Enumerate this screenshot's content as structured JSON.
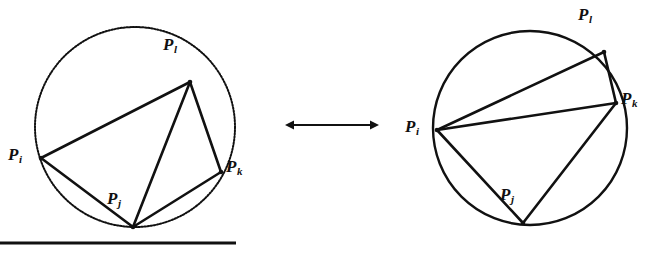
{
  "figure": {
    "type": "geometric-diagram",
    "background_color": "#ffffff",
    "ink_color": "#111111",
    "arrow": {
      "name": "bidirectional-transformation-arrow",
      "glyph": "double-headed-arrow",
      "x1": 285,
      "y1": 125,
      "x2": 379,
      "y2": 125
    },
    "baseline_rule": {
      "name": "page-rule",
      "x1": 0,
      "y1": 243,
      "x2": 236,
      "y2": 243,
      "thickness": 3
    },
    "panels": [
      {
        "id": "left",
        "name": "before-flip",
        "circle": {
          "cx": 135,
          "cy": 127,
          "r": 100,
          "style": "dotted"
        },
        "vertices": [
          {
            "id": "Pl",
            "letter": "P",
            "sub": "l",
            "x": 190,
            "y": 82,
            "label_x": 163,
            "label_y": 36
          },
          {
            "id": "Pi",
            "letter": "P",
            "sub": "i",
            "x": 41,
            "y": 158,
            "label_x": 8,
            "label_y": 146
          },
          {
            "id": "Pj",
            "letter": "P",
            "sub": "j",
            "x": 133,
            "y": 227,
            "label_x": 107,
            "label_y": 190
          },
          {
            "id": "Pk",
            "letter": "P",
            "sub": "k",
            "x": 221,
            "y": 172,
            "label_x": 226,
            "label_y": 158
          }
        ],
        "edges": [
          {
            "from": "Pi",
            "to": "Pl",
            "kind": "hull"
          },
          {
            "from": "Pl",
            "to": "Pk",
            "kind": "hull"
          },
          {
            "from": "Pi",
            "to": "Pj",
            "kind": "hull"
          },
          {
            "from": "Pj",
            "to": "Pk",
            "kind": "hull"
          },
          {
            "from": "Pj",
            "to": "Pl",
            "kind": "diagonal"
          }
        ]
      },
      {
        "id": "right",
        "name": "after-flip",
        "circle": {
          "cx": 530,
          "cy": 128,
          "r": 97,
          "style": "solid"
        },
        "vertices": [
          {
            "id": "Pl",
            "letter": "P",
            "sub": "l",
            "x": 604,
            "y": 52,
            "label_x": 578,
            "label_y": 6
          },
          {
            "id": "Pi",
            "letter": "P",
            "sub": "i",
            "x": 437,
            "y": 130,
            "label_x": 405,
            "label_y": 118
          },
          {
            "id": "Pj",
            "letter": "P",
            "sub": "j",
            "x": 523,
            "y": 223,
            "label_x": 500,
            "label_y": 186
          },
          {
            "id": "Pk",
            "letter": "P",
            "sub": "k",
            "x": 616,
            "y": 103,
            "label_x": 621,
            "label_y": 90
          }
        ],
        "edges": [
          {
            "from": "Pi",
            "to": "Pl",
            "kind": "hull"
          },
          {
            "from": "Pl",
            "to": "Pk",
            "kind": "hull"
          },
          {
            "from": "Pi",
            "to": "Pj",
            "kind": "hull"
          },
          {
            "from": "Pj",
            "to": "Pk",
            "kind": "hull"
          },
          {
            "from": "Pi",
            "to": "Pk",
            "kind": "diagonal"
          }
        ]
      }
    ]
  }
}
